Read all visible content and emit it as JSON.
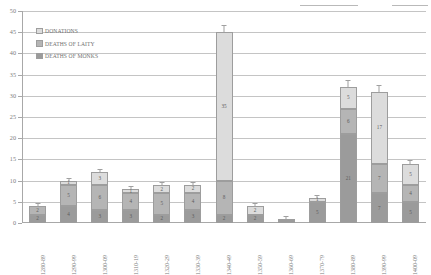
{
  "chart_data": {
    "type": "bar",
    "stacked": true,
    "title": "",
    "xlabel": "",
    "ylabel": "",
    "ylim": [
      0,
      50
    ],
    "ytick_step": 5,
    "yticks": [
      0,
      5,
      10,
      15,
      20,
      25,
      30,
      35,
      40,
      45,
      50
    ],
    "grid": true,
    "legend_position": "top-left",
    "categories": [
      "1280-89",
      "1290-99",
      "1300-09",
      "1310-19",
      "1320-29",
      "1330-39",
      "1340-49",
      "1350-59",
      "1360-69",
      "1370-79",
      "1380-89",
      "1390-99",
      "1400-09"
    ],
    "series": [
      {
        "name": "DEATHS OF MONKS",
        "color": "#9b9b9b",
        "values": [
          2,
          4,
          3,
          3,
          2,
          3,
          2,
          2,
          1,
          5,
          21,
          7,
          5
        ],
        "labels": [
          "2",
          "4",
          "3",
          "3",
          "2",
          "3",
          "2",
          "2",
          "",
          "5",
          "21",
          "7",
          "5"
        ]
      },
      {
        "name": "DEATHS OF LAITY",
        "color": "#b5b5b5",
        "values": [
          2,
          5,
          6,
          4,
          5,
          4,
          8,
          0,
          0,
          0,
          6,
          7,
          4
        ],
        "labels": [
          "2",
          "5",
          "6",
          "4",
          "5",
          "4",
          "8",
          "",
          "",
          "",
          "6",
          "7",
          "4"
        ]
      },
      {
        "name": "DONATIONS",
        "color": "#dcdcdc",
        "values": [
          0,
          1,
          3,
          1,
          2,
          2,
          35,
          2,
          0,
          1,
          5,
          17,
          5
        ],
        "labels": [
          "",
          "1",
          "3",
          "1",
          "2",
          "2",
          "35",
          "2",
          "",
          "1",
          "5",
          "17",
          "5"
        ]
      }
    ],
    "totals": [
      4,
      10,
      12,
      8,
      9,
      9,
      45,
      4,
      1,
      6,
      32,
      31,
      14
    ]
  },
  "legend": {
    "items": [
      {
        "label": "DONATIONS",
        "color": "#dcdcdc"
      },
      {
        "label": "DEATHS OF LAITY",
        "color": "#b5b5b5"
      },
      {
        "label": "DEATHS OF MONKS",
        "color": "#9b9b9b"
      }
    ]
  },
  "axis": {
    "y_labels": [
      "50",
      "45",
      "40",
      "35",
      "30",
      "25",
      "20",
      "15",
      "10",
      "5",
      "0"
    ]
  }
}
